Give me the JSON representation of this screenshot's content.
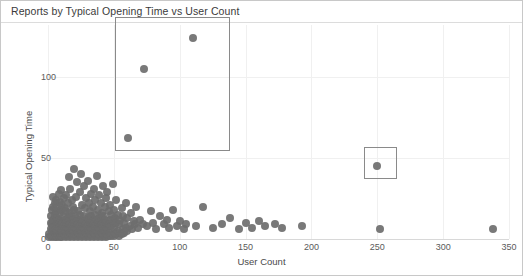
{
  "chart_data": {
    "type": "scatter",
    "title": "Reports by Typical Opening Time vs User Count",
    "xlabel": "User Count",
    "ylabel": "Typical Opening Time",
    "xlim": [
      0,
      350
    ],
    "ylim": [
      0,
      132
    ],
    "xticks": [
      0,
      50,
      100,
      150,
      200,
      250,
      300,
      350
    ],
    "yticks": [
      0,
      50,
      100
    ],
    "grid": true,
    "legend": "none",
    "marker_color": "#6e6e6e",
    "highlight_color": "#8a8a8a",
    "series": [
      {
        "name": "Reports",
        "points": [
          [
            1,
            1
          ],
          [
            1,
            3
          ],
          [
            2,
            2
          ],
          [
            2,
            6
          ],
          [
            2,
            10
          ],
          [
            2,
            14
          ],
          [
            3,
            1
          ],
          [
            3,
            5
          ],
          [
            3,
            9
          ],
          [
            3,
            18
          ],
          [
            4,
            2
          ],
          [
            4,
            7
          ],
          [
            4,
            12
          ],
          [
            4,
            20
          ],
          [
            4,
            26
          ],
          [
            5,
            1
          ],
          [
            5,
            4
          ],
          [
            5,
            8
          ],
          [
            5,
            15
          ],
          [
            5,
            22
          ],
          [
            6,
            2
          ],
          [
            6,
            6
          ],
          [
            6,
            11
          ],
          [
            6,
            17
          ],
          [
            6,
            24
          ],
          [
            7,
            1
          ],
          [
            7,
            5
          ],
          [
            7,
            9
          ],
          [
            7,
            13
          ],
          [
            7,
            19
          ],
          [
            8,
            2
          ],
          [
            8,
            7
          ],
          [
            8,
            12
          ],
          [
            8,
            28
          ],
          [
            9,
            1
          ],
          [
            9,
            4
          ],
          [
            9,
            10
          ],
          [
            9,
            16
          ],
          [
            9,
            23
          ],
          [
            10,
            2
          ],
          [
            10,
            6
          ],
          [
            10,
            11
          ],
          [
            10,
            18
          ],
          [
            10,
            30
          ],
          [
            11,
            1
          ],
          [
            11,
            5
          ],
          [
            11,
            9
          ],
          [
            11,
            21
          ],
          [
            12,
            3
          ],
          [
            12,
            8
          ],
          [
            12,
            14
          ],
          [
            12,
            25
          ],
          [
            13,
            2
          ],
          [
            13,
            6
          ],
          [
            13,
            12
          ],
          [
            13,
            19
          ],
          [
            14,
            1
          ],
          [
            14,
            5
          ],
          [
            14,
            10
          ],
          [
            14,
            17
          ],
          [
            14,
            27
          ],
          [
            15,
            3
          ],
          [
            15,
            7
          ],
          [
            15,
            13
          ],
          [
            15,
            22
          ],
          [
            16,
            2
          ],
          [
            16,
            6
          ],
          [
            16,
            11
          ],
          [
            16,
            38
          ],
          [
            17,
            1
          ],
          [
            17,
            4
          ],
          [
            17,
            9
          ],
          [
            17,
            16
          ],
          [
            17,
            31
          ],
          [
            18,
            3
          ],
          [
            18,
            8
          ],
          [
            18,
            14
          ],
          [
            18,
            24
          ],
          [
            19,
            2
          ],
          [
            19,
            6
          ],
          [
            19,
            12
          ],
          [
            19,
            20
          ],
          [
            20,
            1
          ],
          [
            20,
            5
          ],
          [
            20,
            10
          ],
          [
            20,
            18
          ],
          [
            20,
            43
          ],
          [
            21,
            3
          ],
          [
            21,
            7
          ],
          [
            21,
            13
          ],
          [
            21,
            26
          ],
          [
            22,
            2
          ],
          [
            22,
            6
          ],
          [
            22,
            11
          ],
          [
            22,
            35
          ],
          [
            23,
            1
          ],
          [
            23,
            4
          ],
          [
            23,
            9
          ],
          [
            23,
            17
          ],
          [
            24,
            3
          ],
          [
            24,
            8
          ],
          [
            24,
            15
          ],
          [
            24,
            29
          ],
          [
            25,
            2
          ],
          [
            25,
            6
          ],
          [
            25,
            12
          ],
          [
            25,
            40
          ],
          [
            26,
            1
          ],
          [
            26,
            5
          ],
          [
            26,
            10
          ],
          [
            26,
            21
          ],
          [
            27,
            3
          ],
          [
            27,
            7
          ],
          [
            27,
            14
          ],
          [
            27,
            33
          ],
          [
            28,
            2
          ],
          [
            28,
            6
          ],
          [
            28,
            11
          ],
          [
            28,
            19
          ],
          [
            29,
            1
          ],
          [
            29,
            4
          ],
          [
            29,
            9
          ],
          [
            29,
            25
          ],
          [
            30,
            3
          ],
          [
            30,
            8
          ],
          [
            30,
            13
          ],
          [
            30,
            36
          ],
          [
            31,
            2
          ],
          [
            31,
            6
          ],
          [
            31,
            12
          ],
          [
            31,
            22
          ],
          [
            32,
            1
          ],
          [
            32,
            5
          ],
          [
            32,
            10
          ],
          [
            32,
            17
          ],
          [
            33,
            3
          ],
          [
            33,
            7
          ],
          [
            33,
            14
          ],
          [
            33,
            28
          ],
          [
            34,
            2
          ],
          [
            34,
            6
          ],
          [
            34,
            11
          ],
          [
            34,
            20
          ],
          [
            35,
            1
          ],
          [
            35,
            4
          ],
          [
            35,
            9
          ],
          [
            35,
            31
          ],
          [
            36,
            3
          ],
          [
            36,
            8
          ],
          [
            36,
            15
          ],
          [
            36,
            24
          ],
          [
            37,
            2
          ],
          [
            37,
            6
          ],
          [
            37,
            12
          ],
          [
            37,
            39
          ],
          [
            38,
            1
          ],
          [
            38,
            5
          ],
          [
            38,
            10
          ],
          [
            38,
            18
          ],
          [
            39,
            3
          ],
          [
            39,
            7
          ],
          [
            39,
            13
          ],
          [
            39,
            27
          ],
          [
            40,
            2
          ],
          [
            40,
            6
          ],
          [
            40,
            11
          ],
          [
            40,
            22
          ],
          [
            41,
            1
          ],
          [
            41,
            4
          ],
          [
            41,
            9
          ],
          [
            41,
            16
          ],
          [
            42,
            3
          ],
          [
            42,
            8
          ],
          [
            42,
            14
          ],
          [
            42,
            33
          ],
          [
            43,
            2
          ],
          [
            43,
            6
          ],
          [
            43,
            12
          ],
          [
            43,
            20
          ],
          [
            44,
            1
          ],
          [
            44,
            5
          ],
          [
            44,
            10
          ],
          [
            44,
            25
          ],
          [
            45,
            3
          ],
          [
            45,
            7
          ],
          [
            45,
            29
          ],
          [
            46,
            2
          ],
          [
            46,
            9
          ],
          [
            46,
            17
          ],
          [
            47,
            4
          ],
          [
            47,
            12
          ],
          [
            47,
            21
          ],
          [
            48,
            2
          ],
          [
            48,
            8
          ],
          [
            48,
            15
          ],
          [
            49,
            3
          ],
          [
            49,
            11
          ],
          [
            49,
            34
          ],
          [
            50,
            2
          ],
          [
            50,
            7
          ],
          [
            50,
            18
          ],
          [
            51,
            4
          ],
          [
            51,
            13
          ],
          [
            52,
            3
          ],
          [
            52,
            10
          ],
          [
            52,
            24
          ],
          [
            53,
            5
          ],
          [
            53,
            15
          ],
          [
            54,
            2
          ],
          [
            54,
            9
          ],
          [
            55,
            4
          ],
          [
            55,
            12
          ],
          [
            56,
            3
          ],
          [
            56,
            19
          ],
          [
            57,
            6
          ],
          [
            57,
            14
          ],
          [
            58,
            4
          ],
          [
            58,
            10
          ],
          [
            59,
            7
          ],
          [
            59,
            22
          ],
          [
            60,
            5
          ],
          [
            60,
            13
          ],
          [
            61,
            62
          ],
          [
            62,
            8
          ],
          [
            63,
            16
          ],
          [
            64,
            6
          ],
          [
            65,
            11
          ],
          [
            66,
            9
          ],
          [
            67,
            20
          ],
          [
            68,
            7
          ],
          [
            70,
            12
          ],
          [
            72,
            9
          ],
          [
            73,
            105
          ],
          [
            75,
            8
          ],
          [
            78,
            17
          ],
          [
            80,
            10
          ],
          [
            82,
            6
          ],
          [
            85,
            14
          ],
          [
            88,
            9
          ],
          [
            90,
            12
          ],
          [
            92,
            7
          ],
          [
            95,
            18
          ],
          [
            98,
            8
          ],
          [
            100,
            11
          ],
          [
            103,
            6
          ],
          [
            105,
            9
          ],
          [
            110,
            124
          ],
          [
            112,
            8
          ],
          [
            118,
            20
          ],
          [
            125,
            7
          ],
          [
            132,
            9
          ],
          [
            138,
            13
          ],
          [
            145,
            6
          ],
          [
            150,
            10
          ],
          [
            155,
            7
          ],
          [
            160,
            11
          ],
          [
            165,
            8
          ],
          [
            172,
            9
          ],
          [
            178,
            7
          ],
          [
            193,
            8
          ],
          [
            250,
            45
          ],
          [
            252,
            6
          ],
          [
            338,
            6
          ]
        ]
      }
    ],
    "highlights": [
      {
        "name": "outlier-cluster-box",
        "x0": 51,
        "x1": 138,
        "y0": 54,
        "y1": 137
      },
      {
        "name": "outlier-single-box",
        "x0": 240,
        "x1": 265,
        "y0": 37,
        "y1": 57
      }
    ]
  }
}
